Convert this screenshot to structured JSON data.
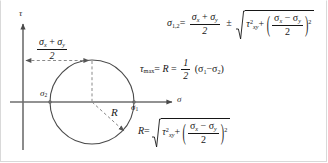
{
  "figure": {
    "colors": {
      "axis": "#6e6e6e",
      "circle": "#4a4a4a",
      "dashed": "#8a8a8a",
      "text": "#161616",
      "border": "#d9d9d9",
      "background": "#ffffff"
    }
  },
  "diagram": {
    "name": "mohrs-circle",
    "axes": {
      "vertical_label": "τ",
      "horizontal_label": "σ"
    },
    "labels": {
      "sigma_1": "σ",
      "sigma_1_sub": "1",
      "sigma_2": "σ",
      "sigma_2_sub": "2",
      "radius": "R"
    },
    "center_offset": {
      "numerator": "σx + σy",
      "numerator_parts": [
        "σ",
        "x",
        "+",
        "σ",
        "y"
      ],
      "denominator": "2"
    },
    "geometry": {
      "circle_center_x": 92,
      "circle_center_y": 102,
      "circle_radius": 42,
      "origin_x": 23,
      "origin_y": 102
    }
  },
  "equations": {
    "principal": {
      "name": "principal-stress-equation",
      "lhs": "σ",
      "lhs_sub": "1,2",
      "equals": "=",
      "frac_num": "σx + σy",
      "frac_den": "2",
      "pm": "±",
      "radicand_tau": "τ",
      "radicand_tau_sub": "xy",
      "radicand_tau_sup": "2",
      "plus": "+",
      "inner_num": "σx − σy",
      "inner_den": "2",
      "inner_sup": "2",
      "sigma": "σ",
      "sub_x": "x",
      "sub_y": "y",
      "sub_xy": "xy"
    },
    "tau_max": {
      "name": "max-shear-equation",
      "lhs": "τ",
      "lhs_sub": "max",
      "equals1": "=",
      "radius": "R",
      "equals2": "=",
      "frac_num": "1",
      "frac_den": "2",
      "expr_open": "(",
      "sigma": "σ",
      "sub_1": "1",
      "minus": "−",
      "sub_2": "2",
      "expr_close": ")"
    },
    "radius": {
      "name": "radius-equation",
      "lhs": "R",
      "equals": "=",
      "radicand_tau": "τ",
      "radicand_tau_sub": "xy",
      "radicand_tau_sup": "2",
      "plus": "+",
      "inner_num": "σx − σy",
      "inner_den": "2",
      "inner_sup": "2",
      "sigma": "σ",
      "sub_x": "x",
      "sub_y": "y"
    }
  }
}
